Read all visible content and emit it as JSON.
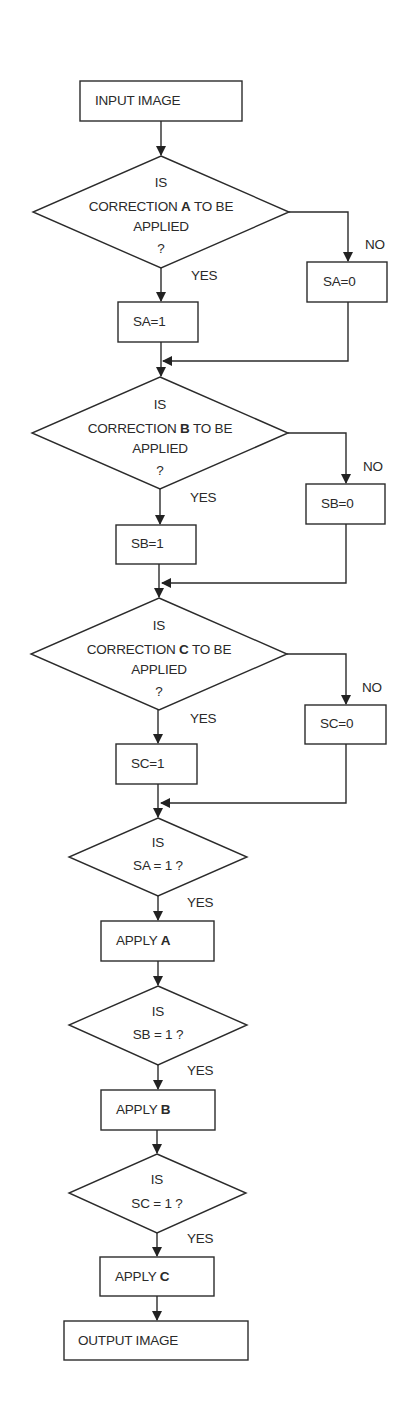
{
  "diagram": {
    "type": "flowchart",
    "start": {
      "label": "INPUT IMAGE"
    },
    "decisions": [
      {
        "id": "dA",
        "line1": "IS",
        "line2_pre": "CORRECTION ",
        "line2_bold": "A",
        "line2_post": " TO BE",
        "line3": "APPLIED",
        "line4": "?",
        "yes": "YES",
        "no": "NO"
      },
      {
        "id": "dB",
        "line1": "IS",
        "line2_pre": "CORRECTION ",
        "line2_bold": "B",
        "line2_post": " TO BE",
        "line3": "APPLIED",
        "line4": "?",
        "yes": "YES",
        "no": "NO"
      },
      {
        "id": "dC",
        "line1": "IS",
        "line2_pre": "CORRECTION ",
        "line2_bold": "C",
        "line2_post": " TO BE",
        "line3": "APPLIED",
        "line4": "?",
        "yes": "YES",
        "no": "NO"
      }
    ],
    "set_yes": [
      "SA=1",
      "SB=1",
      "SC=1"
    ],
    "set_no": [
      "SA=0",
      "SB=0",
      "SC=0"
    ],
    "checks": [
      {
        "line1": "IS",
        "line2": "SA = 1 ?",
        "yes": "YES"
      },
      {
        "line1": "IS",
        "line2": "SB = 1 ?",
        "yes": "YES"
      },
      {
        "line1": "IS",
        "line2": "SC = 1 ?",
        "yes": "YES"
      }
    ],
    "apply": [
      {
        "pre": "APPLY ",
        "bold": "A"
      },
      {
        "pre": "APPLY ",
        "bold": "B"
      },
      {
        "pre": "APPLY ",
        "bold": "C"
      }
    ],
    "end": {
      "label": "OUTPUT IMAGE"
    },
    "colors": {
      "stroke": "#2b2b2b",
      "text": "#2a2a2a",
      "background": "#ffffff"
    }
  }
}
